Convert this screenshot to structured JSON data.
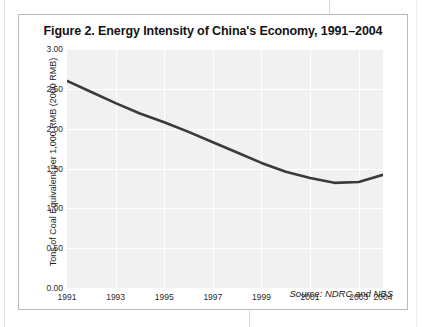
{
  "figure": {
    "title": "Figure 2. Energy Intensity of China's Economy, 1991–2004",
    "source_note": "Source: NDRC and NBS"
  },
  "chart_data": {
    "type": "line",
    "title": "Figure 2. Energy Intensity of China's Economy, 1991–2004",
    "xlabel": "",
    "ylabel": "Tons of Coal Equivalent per 1,000 RMB (2000 RMB)",
    "x": [
      1991,
      1992,
      1993,
      1994,
      1995,
      1996,
      1997,
      1998,
      1999,
      2000,
      2001,
      2002,
      2003,
      2004
    ],
    "values": [
      2.6,
      2.46,
      2.32,
      2.19,
      2.08,
      1.96,
      1.83,
      1.7,
      1.57,
      1.46,
      1.38,
      1.32,
      1.33,
      1.42
    ],
    "series": [
      {
        "name": "Energy intensity",
        "values": [
          2.6,
          2.46,
          2.32,
          2.19,
          2.08,
          1.96,
          1.83,
          1.7,
          1.57,
          1.46,
          1.38,
          1.32,
          1.33,
          1.42
        ],
        "color": "#3a3a3a"
      }
    ],
    "xlim": [
      1991,
      2004
    ],
    "ylim": [
      0.0,
      3.0
    ],
    "yticks": [
      "0.00",
      "0.50",
      "1.00",
      "1.50",
      "2.00",
      "2.50",
      "3.00"
    ],
    "ytick_values": [
      0.0,
      0.5,
      1.0,
      1.5,
      2.0,
      2.5,
      3.0
    ],
    "xticks": [
      "1991",
      "1993",
      "1995",
      "1997",
      "1999",
      "2001",
      "2003",
      "2004"
    ],
    "xtick_values": [
      1991,
      1993,
      1995,
      1997,
      1999,
      2001,
      2003,
      2004
    ],
    "grid": true,
    "legend": false,
    "annotations": [
      "Source: NDRC and NBS"
    ],
    "plot_background": "#f1f1f1",
    "gridline_color": "#ffffff",
    "line_color": "#3a3a3a"
  }
}
